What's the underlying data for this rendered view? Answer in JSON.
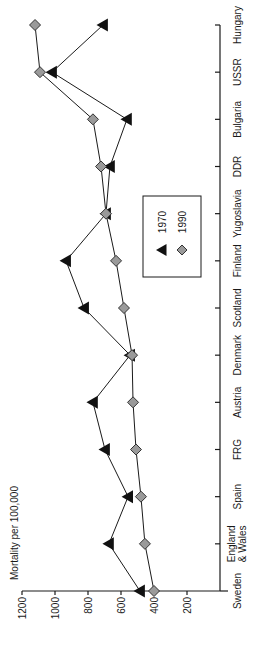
{
  "chart_data": {
    "type": "line",
    "orientation": "rotated-90-ccw",
    "title": "",
    "xlabel": "",
    "ylabel": "Mortality per 100,000",
    "ylim": [
      0,
      1200
    ],
    "yticks": [
      1200,
      1000,
      800,
      600,
      400,
      200
    ],
    "grid": false,
    "legend_position": "inside-center",
    "categories": [
      "Sweden",
      "England & Wales",
      "Spain",
      "FRG",
      "Austria",
      "Denmark",
      "Scotland",
      "Finland",
      "Yugoslavia",
      "DDR",
      "Bulgaria",
      "USSR",
      "Hungary"
    ],
    "category_label_lines": [
      [
        "Sweden"
      ],
      [
        "England",
        "& Wales"
      ],
      [
        "Spain"
      ],
      [
        "FRG"
      ],
      [
        "Austria"
      ],
      [
        "Denmark"
      ],
      [
        "Scotland"
      ],
      [
        "Finland"
      ],
      [
        "Yugoslavia"
      ],
      [
        "DDR"
      ],
      [
        "Bulgaria"
      ],
      [
        "USSR"
      ],
      [
        "Hungary"
      ]
    ],
    "series": [
      {
        "name": "1970",
        "marker": "triangle",
        "color": "#111111",
        "values": [
          485,
          673,
          557,
          697,
          770,
          545,
          824,
          933,
          691,
          667,
          564,
          1018,
          709
        ]
      },
      {
        "name": "1990",
        "marker": "diamond",
        "color": "#9a9a9a",
        "values": [
          400,
          455,
          479,
          509,
          527,
          533,
          582,
          630,
          691,
          721,
          770,
          1091,
          1121
        ]
      }
    ]
  }
}
